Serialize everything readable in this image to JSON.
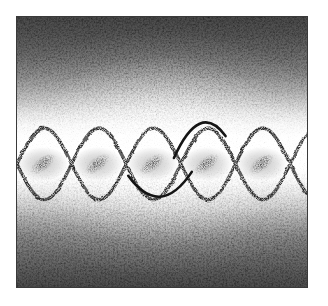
{
  "figure": {
    "kind": "halftone-stipple-plate",
    "caption": "",
    "canvas": {
      "width": 328,
      "height": 306
    },
    "plate": {
      "x": 16,
      "y": 16,
      "width": 292,
      "height": 272,
      "border_color": "#3a3a3a",
      "paper_color": "#ffffff"
    }
  },
  "chart_data": {
    "type": "line",
    "title": "",
    "subtitle": "",
    "xlabel": "",
    "ylabel": "",
    "grid": false,
    "legend": "none",
    "xlim": [
      0,
      292
    ],
    "ylim": [
      0,
      272
    ],
    "series": [
      {
        "name": "sine-upper",
        "kind": "sinusoid",
        "amplitude": 36,
        "wavelength": 110,
        "phase_deg": 0,
        "midline_y": 148,
        "stroke": "#2e2e2e",
        "stroke_width": 3.4
      },
      {
        "name": "sine-lower",
        "kind": "sinusoid",
        "amplitude": 36,
        "wavelength": 110,
        "phase_deg": 180,
        "midline_y": 148,
        "stroke": "#2e2e2e",
        "stroke_width": 3.4
      }
    ],
    "crossings_x": [
      -2,
      53,
      108,
      163,
      218,
      273
    ],
    "lens_cells": [
      {
        "index": 1,
        "center_x": 26,
        "center_y": 148,
        "blob_angle_deg": -38,
        "blob_rx": 15,
        "blob_ry": 7
      },
      {
        "index": 2,
        "center_x": 81,
        "center_y": 148,
        "blob_angle_deg": -38,
        "blob_rx": 15,
        "blob_ry": 7
      },
      {
        "index": 3,
        "center_x": 136,
        "center_y": 148,
        "blob_angle_deg": -38,
        "blob_rx": 15,
        "blob_ry": 7
      },
      {
        "index": 4,
        "center_x": 191,
        "center_y": 148,
        "blob_angle_deg": -38,
        "blob_rx": 15,
        "blob_ry": 7
      },
      {
        "index": 5,
        "center_x": 246,
        "center_y": 148,
        "blob_angle_deg": -38,
        "blob_rx": 15,
        "blob_ry": 7
      }
    ],
    "annotation_arcs": [
      {
        "name": "arc-upper-cap",
        "shape": "inverted-u",
        "x_start": 158,
        "x_end": 210,
        "apex_y": 90,
        "stroke": "#141414",
        "stroke_width": 2.6
      },
      {
        "name": "arc-lower-cap",
        "shape": "u",
        "x_start": 112,
        "x_end": 176,
        "apex_y": 178,
        "stroke": "#141414",
        "stroke_width": 2.6
      }
    ],
    "background": {
      "mode": "vertical-gradient-with-central-highlight",
      "top_value": "#4a4a4a",
      "mid_value": "#ffffff",
      "bottom_value": "#4d4d4d",
      "texture": "random stipple dots, density follows luminance"
    }
  },
  "a11y": {
    "plate_label": "Stippled interference wave plate",
    "waves_label": "Crossing sinusoid pair forming lens cells",
    "background_label": "Graded speckle background"
  }
}
